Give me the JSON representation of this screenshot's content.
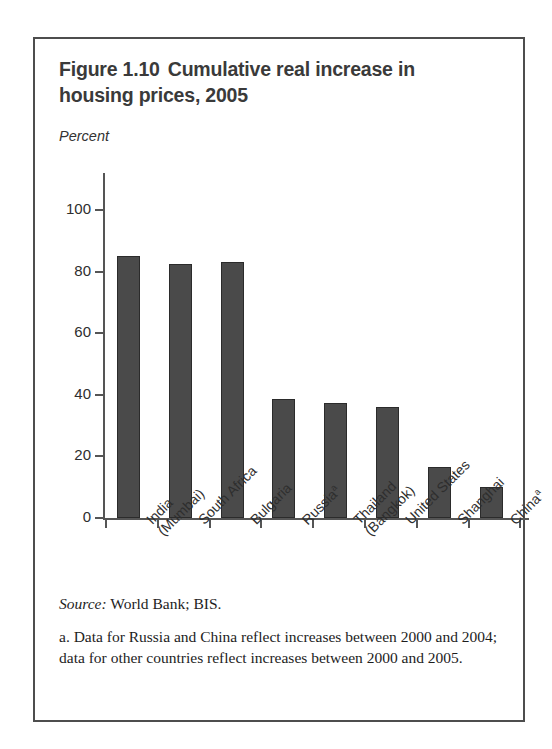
{
  "figure": {
    "title_line1": "Figure 1.10",
    "title_line2": "Cumulative real increase in",
    "title_line3": "housing prices, 2005",
    "axis_unit": "Percent",
    "source_label": "Source:",
    "source_text": "World Bank; BIS.",
    "footnote": "a. Data for Russia and China reflect increases between 2000 and 2004; data for other countries reflect increases between 2000 and 2005.",
    "frame_color": "#4d4d4d",
    "bar_color": "#4a4a4a",
    "bar_edge_color": "#2b2b2b"
  },
  "chart_data": {
    "type": "bar",
    "xlabel": "",
    "ylabel": "Percent",
    "ylim": [
      0,
      100
    ],
    "yticks": [
      0,
      20,
      40,
      60,
      80,
      100
    ],
    "ytick_labels": [
      "0",
      "20",
      "40",
      "60",
      "80",
      "100"
    ],
    "grid": false,
    "legend": "none",
    "categories": [
      "India (Mumbai)",
      "South Africa",
      "Bulgaria",
      "Russia",
      "Thailand (Bangkok)",
      "United States",
      "Shanghai",
      "China"
    ],
    "category_labels": [
      {
        "line1": "India",
        "line2": "(Mumbai)",
        "footnote_mark": ""
      },
      {
        "line1": "South Africa",
        "line2": "",
        "footnote_mark": ""
      },
      {
        "line1": "Bulgaria",
        "line2": "",
        "footnote_mark": ""
      },
      {
        "line1": "Russia",
        "line2": "",
        "footnote_mark": "a"
      },
      {
        "line1": "Thailand",
        "line2": "(Bangkok)",
        "footnote_mark": ""
      },
      {
        "line1": "United States",
        "line2": "",
        "footnote_mark": ""
      },
      {
        "line1": "Shanghai",
        "line2": "",
        "footnote_mark": ""
      },
      {
        "line1": "China",
        "line2": "",
        "footnote_mark": "a"
      }
    ],
    "values": [
      85,
      82.5,
      83,
      38.5,
      37.5,
      36,
      16.5,
      10
    ]
  }
}
